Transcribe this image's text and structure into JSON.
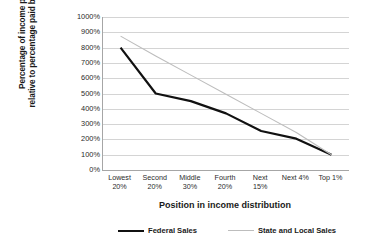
{
  "chart_data": {
    "type": "line",
    "title": "",
    "xlabel": "Position in income distribution",
    "ylabel": "Percentage of income paid, relative to percentage paid by top 1%",
    "ylabel_line1": "Percentage of income paid,",
    "ylabel_line2": "relative to percentage paid by top 1%",
    "categories": [
      "Lowest 20%",
      "Second 20%",
      "Middle 30%",
      "Fourth 20%",
      "Next 15%",
      "Next 4%",
      "Top 1%"
    ],
    "category_lines": [
      [
        "Lowest",
        "20%"
      ],
      [
        "Second",
        "20%"
      ],
      [
        "Middle",
        "30%"
      ],
      [
        "Fourth",
        "20%"
      ],
      [
        "Next",
        "15%"
      ],
      [
        "Next 4%",
        ""
      ],
      [
        "Top 1%",
        ""
      ]
    ],
    "ylim": [
      0,
      1000
    ],
    "ytick_values": [
      0,
      100,
      200,
      300,
      400,
      500,
      600,
      700,
      800,
      900,
      1000
    ],
    "ytick_labels": [
      "0%",
      "100%",
      "200%",
      "300%",
      "400%",
      "500%",
      "600%",
      "700%",
      "800%",
      "900%",
      "1000%"
    ],
    "grid": true,
    "grid_axis": "y",
    "legend_position": "bottom",
    "series": [
      {
        "name": "Federal Sales",
        "color": "#111111",
        "width": 2.2,
        "values": [
          800,
          500,
          450,
          370,
          255,
          205,
          100
        ]
      },
      {
        "name": "State and Local Sales",
        "color": "#bdbdbd",
        "width": 1.1,
        "values": [
          875,
          745,
          620,
          495,
          370,
          245,
          100
        ]
      }
    ]
  },
  "colors": {
    "federal": "#111111",
    "state_local": "#bdbdbd",
    "gridline": "#d4d4d4",
    "axis": "#a6a6a6",
    "background": "#ffffff",
    "text": "#1a1a1a"
  }
}
